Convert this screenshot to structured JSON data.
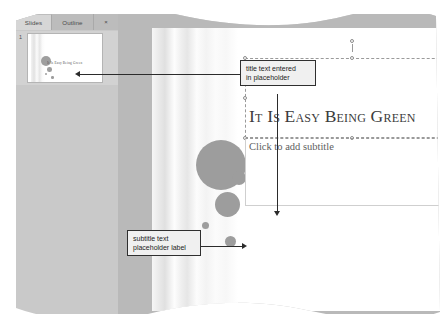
{
  "window": {
    "menu_fragment": "menu"
  },
  "sidebar": {
    "tabs": [
      {
        "label": "Slides",
        "selected": true
      },
      {
        "label": "Outline",
        "selected": false
      }
    ],
    "close_label": "×",
    "slides": [
      {
        "number": "1",
        "thumb_title": "It Is Easy Being Green"
      }
    ]
  },
  "slide": {
    "title_placeholder_text": "It Is Easy Being Green",
    "subtitle_placeholder_text": "Click to add subtitle"
  },
  "callouts": [
    {
      "id": "title",
      "text": "title text entered\nin placeholder"
    },
    {
      "id": "subtitle",
      "text": "subtitle text\nplaceholder label"
    }
  ],
  "colors": {
    "sidebar_bg": "#c9c9c9",
    "editor_bg": "#b9b9b9",
    "slide_bg": "#ffffff",
    "circle_gray": "#9d9d9d",
    "callout_bg": "#f0f0f0",
    "callout_border": "#2f2f2f",
    "title_text": "#3c3c3c",
    "subtitle_text": "#5e5e5e"
  }
}
